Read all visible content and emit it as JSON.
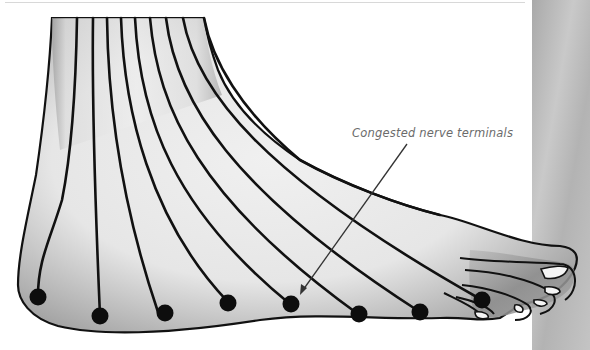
{
  "figure": {
    "annotation": {
      "label": "Congested nerve terminals",
      "arrow_target_dot_index": 4
    },
    "nerve_line_count": 10,
    "terminal_dot_count": 8,
    "colors": {
      "outline": "#111111",
      "skin_light": "#efefef",
      "skin_shade": "#9a9a9a",
      "label_text": "#6b6b6b",
      "side_panel": "#bdbdbd",
      "background": "#ffffff"
    }
  }
}
